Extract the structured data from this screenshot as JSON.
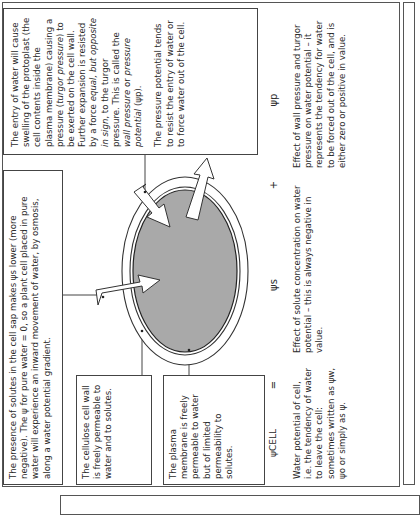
{
  "solute_box": {
    "text": "The presence of solutes in the cell sap makes ψs lower (more negative). The ψ for pure water = 0, so a plant cell placed in pure water will experience an inward movement of water, by osmosis, along a water potential gradient."
  },
  "entry_box": {
    "para1_a": "The entry of water will cause swelling of the protoplast (the cell contents inside the plasma membrane) causing a pressure (",
    "para1_turgor": "turgor pressure",
    "para1_b": ") to be exerted on the cell wall. Further expansion is resisted by a force ",
    "para1_equal": "equal, but opposite in sign",
    "para1_c": ", to the turgor pressure. This is called the ",
    "para1_wall": "wall pressure",
    "para1_or": " or ",
    "para1_pp": "pressure potential",
    "para1_d": " (ψp).",
    "para2": "The pressure potential tends to resist the entry of water or to force water out of the cell."
  },
  "cellulose_box": {
    "text": "The cellulose cell wall is freely permeable to water and to solutes."
  },
  "plasma_box": {
    "text": "The plasma membrane is freely permeable to water but of limited permeability to solutes."
  },
  "equation": {
    "psi_cell": "ψCELL",
    "equals": "=",
    "psi_s": "ψs",
    "plus": "+",
    "psi_p": "ψp"
  },
  "descriptions": {
    "cell": "Water potential of cell, i.e. the tendency of water to leave the cell: sometimes written as ψw, ψo or simply as ψ.",
    "solute": "Effect of solute concentration on water potential – this is always negative in value.",
    "pressure": "Effect of wall pressure and turgor pressure on water potential – it represents the tendency for water to be forced out of the cell, and is either zero or positive in value."
  },
  "colors": {
    "protoplast_fill": "#a9a9a9",
    "line": "#444444"
  }
}
